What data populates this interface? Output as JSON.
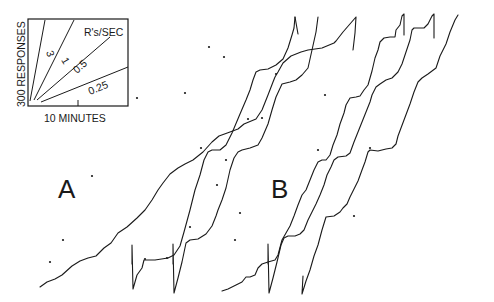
{
  "chart_data": {
    "type": "line",
    "panels": [
      {
        "label": "A",
        "description": "Cumulative response records, panel A"
      },
      {
        "label": "B",
        "description": "Cumulative response records, panel B"
      }
    ],
    "inset": {
      "xlabel": "10 MINUTES",
      "ylabel": "300 RESPONSES",
      "rate_title": "R's/SEC",
      "rates": [
        {
          "label": "3",
          "value": 3
        },
        {
          "label": "1",
          "value": 1
        },
        {
          "label": "0.5",
          "value": 0.5
        },
        {
          "label": "0.25",
          "value": 0.25
        }
      ]
    },
    "series": [
      {
        "name": "A-1",
        "path": "M 40 287 L 47 282 L 55 279 L 62 275 L 72 266 L 80 261 L 88 258 L 96 256 L 104 248 L 111 243 L 118 233 L 127 227 L 137 218 L 145 210 L 152 200 L 158 190 L 163 183 L 170 174 L 178 168 L 185 164 L 193 160 L 203 152 L 212 142 L 219 136 L 230 132 L 238 129 L 244 124 L 256 119 L 262 110 L 268 95 L 273 82 L 275 77 L 278 72 L 283 63 L 291 56 L 301 52 L 308 50 L 322 48 L 334 43 L 336 41 L 343 32 L 356 17 L 355 33 L 353 50"
      },
      {
        "name": "A-1-lower",
        "path": "M 56 91 L 0 0"
      },
      {
        "name": "A-2",
        "path": "M 132 264 L 132 245 L 133 289 L 137 275 L 142 268 L 144 260 L 146 260 L 155 260 L 168 258 L 174 255 L 180 246 L 184 232 L 190 210 L 195 190 L 200 175 L 204 160 L 208 152 L 212 150 L 220 150 L 226 145 L 232 133 L 240 114 L 246 100 L 250 90 L 253 80 L 256 72 L 260 70 L 268 69 L 276 65 L 283 59 L 288 48 L 292 35 L 294 28 L 295 17"
      },
      {
        "name": "A-2-hook",
        "path": "M 295 17 L 298 34"
      },
      {
        "name": "A-3",
        "path": "M 173 264 L 173 244 L 174 293 L 178 278 L 182 262 L 186 243 L 190 240 L 198 239 L 206 234 L 212 226 L 216 216 L 218 210 L 222 200 L 226 188 L 230 170 L 234 158 L 238 152 L 242 150 L 250 148 L 258 145 L 262 138 L 268 124 L 272 110 L 276 97 L 282 84 L 290 82 L 296 80 L 302 75 L 308 68 L 312 50 L 316 32 L 318 17"
      },
      {
        "name": "B-1",
        "path": "M 222 291 L 228 289 L 236 285 L 242 282 L 246 277 L 250 277 L 255 275 L 258 268 L 262 264 L 268 262 L 275 260 L 278 255 L 282 240 L 286 233 L 290 226 L 294 216 L 298 205 L 302 195 L 306 190 L 310 180 L 314 170 L 318 162 L 322 160 L 326 160 L 330 155 L 333 145 L 337 135 L 340 124 L 344 113 L 346 105 L 350 98 L 356 97 L 360 96 L 364 90 L 368 85 L 372 71 L 375 58 L 378 50 L 380 42 L 384 38 L 390 37 L 395 37 L 396 30 L 400 25 L 402 16 L 404 14 L 404 35"
      },
      {
        "name": "B-2",
        "path": "M 268 264 L 268 244 L 269 293 L 273 278 L 277 262 L 281 245 L 284 238 L 288 236 L 295 236 L 300 234 L 304 230 L 308 220 L 312 212 L 316 204 L 320 195 L 324 185 L 327 175 L 331 167 L 334 160 L 338 157 L 346 156 L 350 153 L 354 142 L 358 132 L 362 122 L 366 112 L 370 102 L 372 95 L 376 87 L 380 84 L 386 80 L 392 78 L 398 72 L 402 64 L 406 52 L 410 40 L 412 30 L 414 28 L 424 28 L 428 24 L 432 16 L 434 14 L 434 38"
      },
      {
        "name": "B-3",
        "path": "M 303 276 L 302 294 L 306 281 L 310 270 L 314 256 L 318 245 L 322 230 L 326 217 L 334 216 L 340 212 L 343 208 L 347 204 L 350 197 L 354 189 L 358 181 L 362 170 L 365 162 L 368 152 L 370 150 L 378 151 L 386 149 L 392 148 L 396 144 L 398 136 L 401 128 L 404 120 L 410 104 L 414 92 L 418 82 L 422 78 L 428 74 L 436 68 L 440 56 L 446 44 L 450 32 L 455 20 L 458 15"
      }
    ],
    "markers": [
      [
        50,
        262
      ],
      [
        63,
        240
      ],
      [
        92,
        176
      ],
      [
        137,
        98
      ],
      [
        185,
        93
      ],
      [
        224,
        57
      ],
      [
        145,
        259
      ],
      [
        167,
        258
      ],
      [
        190,
        227
      ],
      [
        201,
        148
      ],
      [
        226,
        160
      ],
      [
        217,
        185
      ],
      [
        209,
        47
      ],
      [
        235,
        240
      ],
      [
        240,
        213
      ],
      [
        248,
        119
      ],
      [
        262,
        118
      ],
      [
        276,
        74
      ],
      [
        325,
        95
      ],
      [
        318,
        150
      ],
      [
        354,
        216
      ],
      [
        370,
        148
      ]
    ],
    "xlabel": "",
    "ylabel": "",
    "grid": false,
    "legend": "inset, upper left"
  }
}
